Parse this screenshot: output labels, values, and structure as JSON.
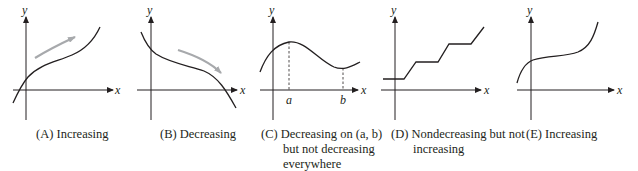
{
  "figure": {
    "panels": [
      {
        "id": "A",
        "caption": "(A) Increasing",
        "caption_lines": [
          "(A) Increasing"
        ],
        "x_axis_label": "x",
        "y_axis_label": "y",
        "curve": "increasing",
        "direction_arrow": "up-right"
      },
      {
        "id": "B",
        "caption": "(B) Decreasing",
        "caption_lines": [
          "(B) Decreasing"
        ],
        "x_axis_label": "x",
        "y_axis_label": "y",
        "curve": "decreasing",
        "direction_arrow": "down-right"
      },
      {
        "id": "C",
        "caption": "(C) Decreasing on (a, b) but not decreasing everywhere",
        "caption_lines": [
          "(C) Decreasing on (a, b)",
          "but not decreasing",
          "everywhere"
        ],
        "x_axis_label": "x",
        "y_axis_label": "y",
        "tick_labels": [
          "a",
          "b"
        ],
        "curve": "local max at a, local min at b"
      },
      {
        "id": "D",
        "caption": "(D) Nondecreasing but not increasing",
        "caption_lines": [
          "(D) Nondecreasing but not",
          "increasing"
        ],
        "x_axis_label": "x",
        "y_axis_label": "y",
        "curve": "staircase"
      },
      {
        "id": "E",
        "caption": "(E) Increasing",
        "caption_lines": [
          "(E) Increasing"
        ],
        "x_axis_label": "x",
        "y_axis_label": "y",
        "curve": "cubic-like increasing"
      }
    ],
    "colors": {
      "ink": "#231f20",
      "arrow": "#a7a9ac",
      "background": "#ffffff"
    }
  }
}
